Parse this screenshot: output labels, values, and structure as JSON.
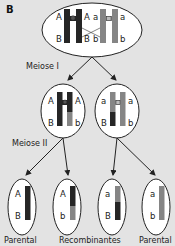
{
  "panel_label": "B",
  "colors": {
    "background": "#e3e3e3",
    "dark_chromosome": "#262626",
    "light_chromosome": "#858585",
    "cell_fill": "#ffffff",
    "outline": "#222222"
  },
  "stages": {
    "meiosis1": "Meiose I",
    "meiosis2": "Meiose II"
  },
  "top_cell": {
    "alleles_left": [
      "A",
      "B"
    ],
    "alleles_mid_left": [
      "A",
      "B"
    ],
    "alleles_mid_right": [
      "a",
      "b"
    ],
    "alleles_right": [
      "a",
      "b"
    ],
    "crossover": true
  },
  "middle_cells": [
    {
      "left": [
        "A",
        "B"
      ],
      "right": [
        "A",
        "b"
      ]
    },
    {
      "left": [
        "a",
        "B"
      ],
      "right": [
        "a",
        "b"
      ]
    }
  ],
  "gametes": [
    {
      "top": "A",
      "bottom": "B",
      "label": "Parental"
    },
    {
      "top": "A",
      "bottom": "b",
      "label": ""
    },
    {
      "top": "a",
      "bottom": "B",
      "label": ""
    },
    {
      "top": "a",
      "bottom": "b",
      "label": "Parental"
    }
  ],
  "group_label": "Recombinantes"
}
